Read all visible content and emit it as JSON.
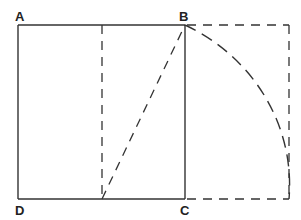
{
  "diagram": {
    "type": "golden-rectangle-construction",
    "colors": {
      "stroke": "#333333",
      "background": "#ffffff",
      "label": "#222222"
    },
    "points": {
      "A": {
        "label": "A",
        "x": 18,
        "y": 25
      },
      "B": {
        "label": "B",
        "x": 185,
        "y": 25
      },
      "C": {
        "label": "C",
        "x": 185,
        "y": 199
      },
      "D": {
        "label": "D",
        "x": 18,
        "y": 199
      },
      "M": {
        "x": 102,
        "y": 199
      },
      "E": {
        "x": 289,
        "y": 199
      },
      "F": {
        "x": 289,
        "y": 25
      }
    },
    "labels": [
      {
        "id": "A",
        "text": "A",
        "x": 15,
        "y": 21
      },
      {
        "id": "B",
        "text": "B",
        "x": 180,
        "y": 21
      },
      {
        "id": "C",
        "text": "C",
        "x": 180,
        "y": 215
      },
      {
        "id": "D",
        "text": "D",
        "x": 15,
        "y": 215
      }
    ],
    "elements": [
      {
        "name": "square-ABCD",
        "style": "solid"
      },
      {
        "name": "midline",
        "style": "dashed"
      },
      {
        "name": "diagonal-M-to-B",
        "style": "dashed"
      },
      {
        "name": "arc-B-to-E",
        "style": "dashed"
      },
      {
        "name": "extension-rectangle",
        "style": "dashed"
      }
    ]
  }
}
